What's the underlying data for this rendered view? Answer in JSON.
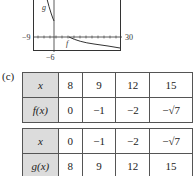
{
  "graph": {
    "xmin_label": "−9",
    "xmax_label": "30",
    "ymin_label": "−6",
    "curve_labels": [
      "g",
      "f"
    ]
  },
  "part_label": "(c)",
  "table_f": {
    "rows": [
      {
        "label": "x",
        "values": [
          "8",
          "9",
          "12",
          "15"
        ]
      },
      {
        "label": "f(x)",
        "values": [
          "0",
          "−1",
          "−2",
          "−√7"
        ]
      }
    ]
  },
  "table_g": {
    "rows": [
      {
        "label": "x",
        "values": [
          "0",
          "−1",
          "−2",
          "−√7"
        ]
      },
      {
        "label": "g(x)",
        "values": [
          "8",
          "9",
          "12",
          "15"
        ]
      }
    ]
  }
}
